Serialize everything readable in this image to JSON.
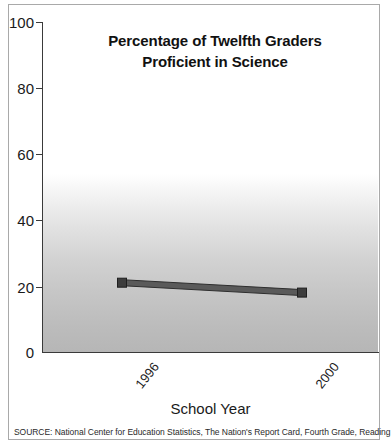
{
  "chart_data": {
    "type": "line",
    "title": "Percentage of Twelfth Graders Proficient in Science",
    "title_line1": "Percentage of Twelfth Graders",
    "title_line2": "Proficient in Science",
    "xlabel": "School Year",
    "ylabel": "",
    "categories": [
      "1996",
      "2000"
    ],
    "x": [
      1996,
      2000
    ],
    "series": [
      {
        "name": "Percent proficient",
        "values": [
          21,
          18
        ]
      }
    ],
    "ylim": [
      0,
      100
    ],
    "yticks": [
      0,
      20,
      40,
      60,
      80,
      100
    ],
    "ytick_labels": [
      "0",
      "20",
      "40",
      "60",
      "80",
      "100"
    ],
    "xticks": [
      "1996",
      "2000"
    ],
    "grid": false,
    "legend": false,
    "line_color": "#4a4a4a",
    "marker": "square",
    "background": "white-to-gray-vertical-gradient",
    "source": "SOURCE: National Center for Education Statistics, The Nation's Report Card, Fourth Grade, Reading 2000."
  },
  "axis": {
    "y_labels": [
      "100",
      "80",
      "60",
      "40",
      "20",
      "0"
    ],
    "x_labels": [
      "1996",
      "2000"
    ],
    "x_title": "School Year"
  },
  "notes": {
    "source": "SOURCE: National Center for Education Statistics, The Nation's Report Card, Fourth Grade, Reading 2000."
  }
}
